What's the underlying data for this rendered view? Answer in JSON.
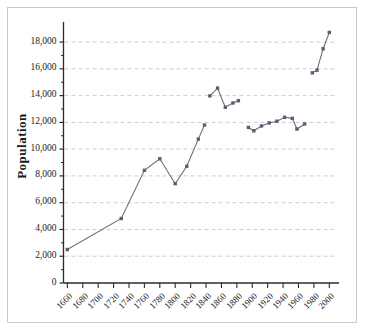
{
  "chart_data": {
    "type": "line",
    "title": "",
    "xlabel": "",
    "ylabel": "Population",
    "xlim": [
      1655,
      2010
    ],
    "ylim": [
      0,
      19200
    ],
    "grid": true,
    "grid_axis": "y",
    "legend": "none",
    "xticks": [
      1660,
      1680,
      1700,
      1720,
      1740,
      1760,
      1780,
      1800,
      1820,
      1840,
      1860,
      1880,
      1900,
      1920,
      1940,
      1960,
      1980,
      2000
    ],
    "xtick_labels": [
      "1660",
      "1680",
      "1700",
      "1720",
      "1740",
      "1760",
      "1780",
      "1800",
      "1820",
      "1840",
      "1860",
      "1880",
      "1900",
      "1920",
      "1940",
      "1960",
      "1980",
      "2000"
    ],
    "yticks": [
      0,
      2000,
      4000,
      6000,
      8000,
      10000,
      12000,
      14000,
      16000,
      18000
    ],
    "ytick_labels": [
      "0",
      "2,000",
      "4,000",
      "6,000",
      "8,000",
      "10,000",
      "12,000",
      "14,000",
      "16,000",
      "18,000"
    ],
    "marker": "square",
    "marker_color": "#58606e",
    "line_color": "#6b6f78",
    "grid_color": "#8fa4c4",
    "axis_color": "#2b2b2b",
    "series": [
      {
        "name": "segment-1",
        "x": [
          1660,
          1730,
          1760,
          1780,
          1800,
          1815,
          1830,
          1838
        ],
        "values": [
          2500,
          4820,
          8420,
          9280,
          7420,
          8720,
          10750,
          11800
        ]
      },
      {
        "name": "segment-2",
        "x": [
          1845,
          1855,
          1865,
          1875,
          1882
        ],
        "values": [
          13980,
          14560,
          13130,
          13450,
          13620
        ]
      },
      {
        "name": "segment-3",
        "x": [
          1895,
          1902,
          1912,
          1922,
          1932,
          1942,
          1952,
          1958,
          1968
        ],
        "values": [
          11620,
          11370,
          11730,
          11960,
          12090,
          12380,
          12300,
          11500,
          11880
        ]
      },
      {
        "name": "segment-4",
        "x": [
          1978,
          1984,
          1992,
          2000
        ],
        "values": [
          15700,
          15900,
          17500,
          18720
        ]
      }
    ]
  }
}
